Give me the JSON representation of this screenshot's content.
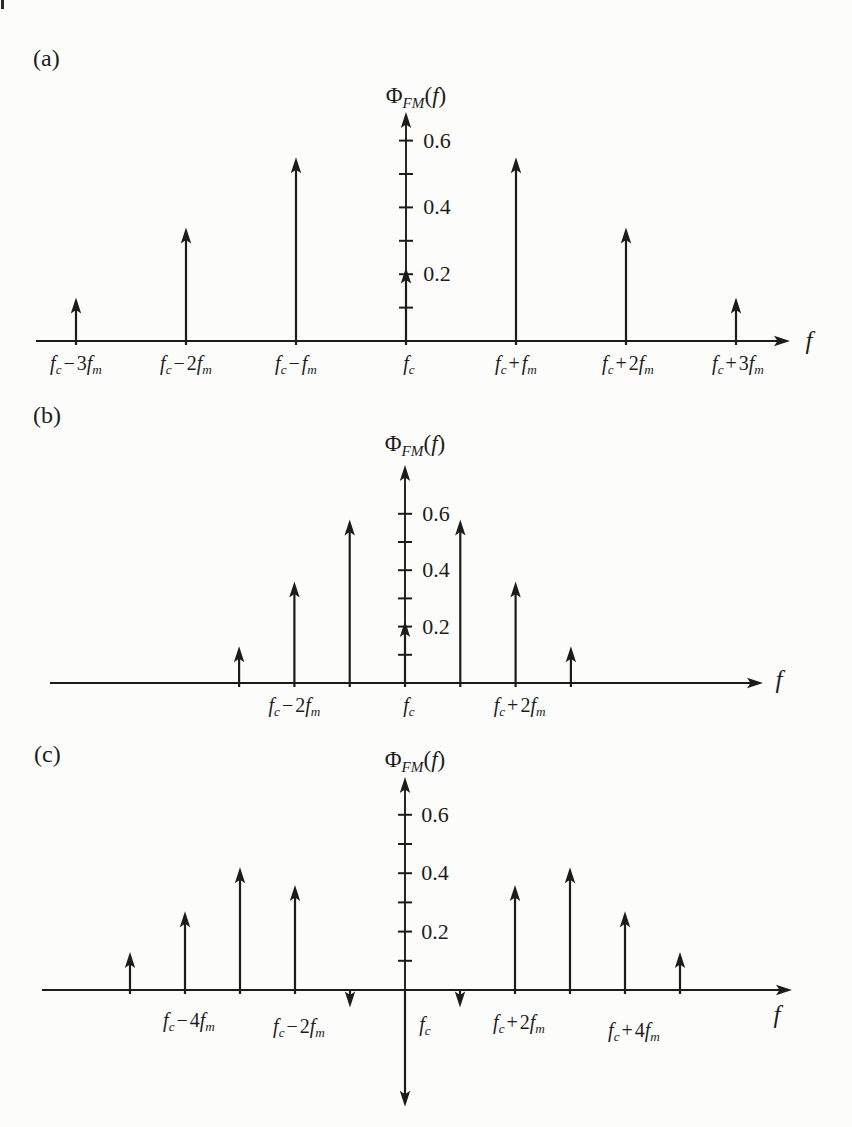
{
  "page": {
    "background": "#fcfcfa",
    "ink": "#1c1c1c",
    "page_edge_mark": true
  },
  "chart_data": {
    "type": "stem",
    "y_tick_step": 0.1,
    "y_axis_range": [
      0,
      0.7
    ],
    "panels": [
      {
        "id": "a",
        "panel_label": "(a)",
        "title": "Φ_FM(f)",
        "x_axis_label": "f",
        "y_ticks": [
          0.1,
          0.2,
          0.3,
          0.4,
          0.5,
          0.6
        ],
        "y_tick_labels": [
          {
            "value": 0.2,
            "label": "0.2"
          },
          {
            "value": 0.4,
            "label": "0.4"
          },
          {
            "value": 0.6,
            "label": "0.6"
          }
        ],
        "stems": [
          {
            "n": -3,
            "value": 0.13,
            "label": "f_c − 3f_m"
          },
          {
            "n": -2,
            "value": 0.34,
            "label": "f_c − 2f_m"
          },
          {
            "n": -1,
            "value": 0.55,
            "label": "f_c − f_m"
          },
          {
            "n": 0,
            "value": 0.22,
            "label": "f_c",
            "label_dx": 3
          },
          {
            "n": 1,
            "value": 0.55,
            "label": "f_c + f_m"
          },
          {
            "n": 2,
            "value": 0.34,
            "label": "f_c + 2f_m",
            "label_dx": 2
          },
          {
            "n": 3,
            "value": 0.13,
            "label": "f_c + 3f_m",
            "label_dx": 2
          }
        ],
        "layout": {
          "axis_x": 406,
          "baseline_y": 341,
          "px_per_value": 334,
          "px_per_n": 110,
          "y_axis_tip_y": 112,
          "x_axis_start_x": 36,
          "x_axis_tip_x": 790,
          "title_cx": 416,
          "title_cy": 95,
          "tick_label_cx": 437,
          "stem_label_cy": 363,
          "f_label_cx": 809,
          "f_label_cy": 340,
          "panel_label_x": 33,
          "panel_label_y": 46
        }
      },
      {
        "id": "b",
        "panel_label": "(b)",
        "title": "Φ_FM(f)",
        "x_axis_label": "f",
        "y_ticks": [
          0.1,
          0.2,
          0.3,
          0.4,
          0.5,
          0.6
        ],
        "y_tick_labels": [
          {
            "value": 0.2,
            "label": "0.2"
          },
          {
            "value": 0.4,
            "label": "0.4"
          },
          {
            "value": 0.6,
            "label": "0.6"
          }
        ],
        "stems": [
          {
            "n": -3,
            "value": 0.13
          },
          {
            "n": -2,
            "value": 0.36,
            "label": "f_c − 2f_m"
          },
          {
            "n": -1,
            "value": 0.58
          },
          {
            "n": 0,
            "value": 0.22,
            "label": "f_c",
            "label_dx": 4
          },
          {
            "n": 1,
            "value": 0.58
          },
          {
            "n": 2,
            "value": 0.36,
            "label": "f_c + 2f_m",
            "label_dx": 4
          },
          {
            "n": 3,
            "value": 0.13
          }
        ],
        "layout": {
          "axis_x": 405,
          "baseline_y": 683,
          "px_per_value": 282,
          "px_per_n": 55.3,
          "y_axis_tip_y": 465,
          "x_axis_start_x": 50,
          "x_axis_tip_x": 763,
          "title_cx": 415,
          "title_cy": 443,
          "tick_label_cx": 436,
          "stem_label_cy": 705,
          "f_label_cx": 779,
          "f_label_cy": 679,
          "panel_label_x": 33,
          "panel_label_y": 403
        }
      },
      {
        "id": "c",
        "panel_label": "(c)",
        "title": "Φ_FM(f)",
        "x_axis_label": "f",
        "y_ticks": [
          0.1,
          0.2,
          0.3,
          0.4,
          0.5,
          0.6
        ],
        "y_tick_labels": [
          {
            "value": 0.2,
            "label": "0.2"
          },
          {
            "value": 0.4,
            "label": "0.4"
          },
          {
            "value": 0.6,
            "label": "0.6"
          }
        ],
        "stems": [
          {
            "n": -5,
            "value": 0.13
          },
          {
            "n": -4,
            "value": 0.27,
            "label": "f_c − 4f_m",
            "label_dx": 4,
            "label_dy": -4
          },
          {
            "n": -3,
            "value": 0.42
          },
          {
            "n": -2,
            "value": 0.36,
            "label": "f_c − 2f_m",
            "label_dx": 4,
            "label_dy": 2
          },
          {
            "n": -1,
            "value": -0.06
          },
          {
            "n": 0,
            "value": -0.4,
            "label": "f_c",
            "label_dx": 20
          },
          {
            "n": 1,
            "value": -0.06
          },
          {
            "n": 2,
            "value": 0.36,
            "label": "f_c + 2f_m",
            "label_dx": 4,
            "label_dy": -2
          },
          {
            "n": 3,
            "value": 0.42
          },
          {
            "n": 4,
            "value": 0.27,
            "label": "f_c + 4f_m",
            "label_dx": 9,
            "label_dy": 6
          },
          {
            "n": 5,
            "value": 0.13
          }
        ],
        "layout": {
          "axis_x": 405,
          "baseline_y": 990,
          "px_per_value": 292,
          "px_per_n": 55,
          "y_axis_tip_y": 777,
          "x_axis_start_x": 42,
          "x_axis_tip_x": 792,
          "title_cx": 415,
          "title_cy": 759,
          "tick_label_cx": 435,
          "stem_label_cy": 1024,
          "f_label_cx": 777,
          "f_label_cy": 1014,
          "panel_label_x": 34,
          "panel_label_y": 742
        }
      }
    ]
  }
}
